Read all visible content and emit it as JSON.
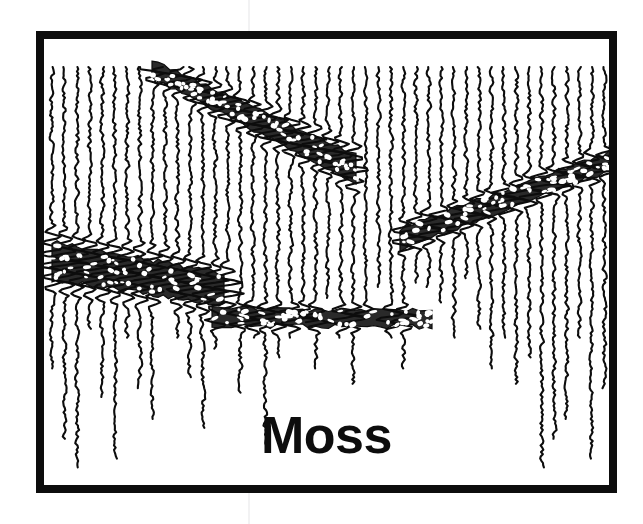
{
  "figure": {
    "kind": "seismic-wiggle-trace-section",
    "caption": "Moss",
    "background_color": "#ffffff",
    "ink_color": "#0d0d0d",
    "frame": {
      "x": 36,
      "y": 31,
      "width": 581,
      "height": 462,
      "border_width": 8,
      "border_color": "#0d0d0d",
      "fill_color": "#ffffff"
    },
    "caption_style": {
      "font_size_px": 52,
      "weight": "bold",
      "align": "center",
      "color": "#0d0d0d"
    }
  },
  "chart_data": {
    "type": "line",
    "title": "Moss",
    "xlabel": "",
    "ylabel": "",
    "grid": false,
    "legend": "none",
    "axis_visible": false,
    "tick_labels_x": [],
    "tick_labels_y": [],
    "trace_count": 46,
    "trace_spacing_px": 12,
    "x_range_px": [
      8,
      573
    ],
    "y_range_px": [
      8,
      454
    ],
    "jitter_amplitude_px": 2.2,
    "line_width_px": 2.0,
    "trace_start_y_px": 28,
    "trace_end_y_values_px": [
      330,
      400,
      430,
      290,
      360,
      420,
      300,
      350,
      380,
      250,
      300,
      340,
      390,
      310,
      270,
      355,
      300,
      410,
      320,
      300,
      285,
      330,
      260,
      300,
      345,
      280,
      250,
      300,
      330,
      245,
      250,
      265,
      300,
      240,
      290,
      330,
      300,
      345,
      320,
      430,
      400,
      380,
      300,
      420,
      350,
      300
    ],
    "reflection_bands": [
      {
        "name": "upper-dipping-band",
        "shape": "wedge",
        "x_start_px": 108,
        "x_end_px": 312,
        "y_at_start_px": 30,
        "y_at_end_px": 130,
        "thickness_start_px": 34,
        "thickness_end_px": 52,
        "amplitude": "high",
        "dip": "down-to-the-right"
      },
      {
        "name": "right-dipping-band",
        "shape": "wedge",
        "x_start_px": 356,
        "x_end_px": 572,
        "y_at_start_px": 200,
        "y_at_end_px": 120,
        "thickness_start_px": 40,
        "thickness_end_px": 36,
        "amplitude": "high",
        "dip": "up-to-the-right"
      },
      {
        "name": "lower-left-block",
        "shape": "blob",
        "x_start_px": 8,
        "x_end_px": 180,
        "y_at_start_px": 222,
        "y_at_end_px": 250,
        "thickness_start_px": 72,
        "thickness_end_px": 60,
        "amplitude": "very-high",
        "dip": "near-horizontal"
      },
      {
        "name": "lower-horizontal-band",
        "shape": "wedge",
        "x_start_px": 168,
        "x_end_px": 388,
        "y_at_start_px": 278,
        "y_at_end_px": 280,
        "thickness_start_px": 34,
        "thickness_end_px": 30,
        "amplitude": "high",
        "dip": "flat"
      }
    ]
  }
}
